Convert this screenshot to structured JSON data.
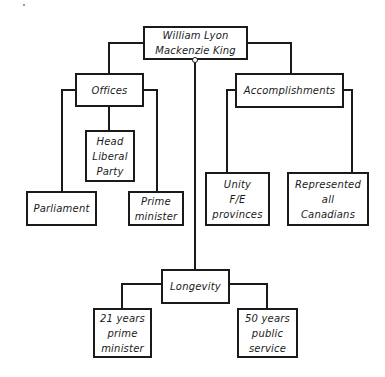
{
  "diagram": {
    "type": "concept-map",
    "root": {
      "label": "William Lyon\nMackenzie King"
    },
    "branches": {
      "offices": {
        "label": "Offices",
        "children": [
          {
            "label": "Parliament"
          },
          {
            "label": "Head\nLiberal\nParty"
          },
          {
            "label": "Prime\nminister"
          }
        ]
      },
      "accomplishments": {
        "label": "Accomplishments",
        "children": [
          {
            "label": "Unity\nF/E\nprovinces"
          },
          {
            "label": "Represented\nall\nCanadians"
          }
        ]
      },
      "longevity": {
        "label": "Longevity",
        "children": [
          {
            "label": "21 years\nprime\nminister"
          },
          {
            "label": "50 years\npublic\nservice"
          }
        ]
      }
    },
    "colors": {
      "line": "#1a1a1a",
      "background": "#ffffff"
    }
  }
}
